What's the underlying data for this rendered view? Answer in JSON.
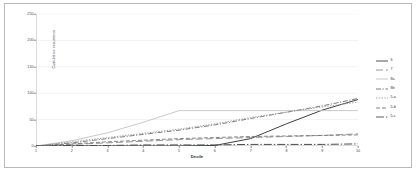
{
  "chart_data": {
    "type": "line",
    "title": "",
    "xlabel": "Decile",
    "ylabel": "Cumulative occurrence",
    "x": [
      1,
      2,
      3,
      4,
      5,
      6,
      7,
      8,
      9,
      10
    ],
    "xtick_labels": [
      "1",
      "2",
      "3",
      "4",
      "5",
      "6",
      "7",
      "8",
      "9",
      "10"
    ],
    "ytick_labels": [
      "0",
      "50",
      "100",
      "150",
      "200",
      "250"
    ],
    "yticks": [
      0,
      50,
      100,
      150,
      200,
      250
    ],
    "ylim": [
      0,
      250
    ],
    "xlim": [
      1,
      10
    ],
    "grid": "horizontal",
    "legend_position": "right",
    "series": [
      {
        "name": "6",
        "label": "6",
        "color": "#3f3f3f",
        "dash": "solid",
        "width": 1.0,
        "values": [
          0,
          0,
          0,
          0,
          0,
          1,
          14,
          42,
          68,
          88
        ]
      },
      {
        "name": "7",
        "label": "7",
        "color": "#8a8a8a",
        "dash": "dashed-long",
        "width": 0.9,
        "values": [
          0,
          3,
          6,
          9,
          12,
          14,
          16,
          18,
          20,
          23
        ]
      },
      {
        "name": "8a",
        "label": "8a",
        "color": "#c2c2c2",
        "dash": "solid",
        "width": 0.9,
        "values": [
          0,
          10,
          25,
          45,
          67,
          67,
          67,
          67,
          67,
          67
        ]
      },
      {
        "name": "8b",
        "label": "8b",
        "color": "#6e6e6e",
        "dash": "dash-dot",
        "width": 0.9,
        "values": [
          0,
          6,
          14,
          22,
          30,
          40,
          52,
          64,
          76,
          90
        ]
      },
      {
        "name": "5-a",
        "label": "5-a",
        "color": "#9a9a9a",
        "dash": "dotted",
        "width": 0.9,
        "values": [
          0,
          8,
          16,
          24,
          32,
          42,
          54,
          64,
          74,
          83
        ]
      },
      {
        "name": "5-b",
        "label": "5-b",
        "color": "#777777",
        "dash": "dashed",
        "width": 0.9,
        "values": [
          0,
          4,
          8,
          11,
          14,
          16,
          18,
          19,
          20,
          21
        ]
      },
      {
        "name": "5-c",
        "label": "5-c",
        "color": "#4a4a4a",
        "dash": "dash-dot-long",
        "width": 1.0,
        "values": [
          0,
          1,
          1,
          2,
          2,
          2,
          3,
          3,
          3,
          4
        ]
      }
    ]
  }
}
